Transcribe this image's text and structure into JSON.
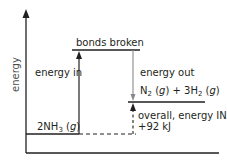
{
  "diagram": {
    "type": "energy-level-diagram",
    "axis": {
      "y_label": "energy"
    },
    "levels": [
      {
        "id": "reactants",
        "label_main": "2NH",
        "label_sub": "3",
        "label_state": " (",
        "label_italic": "g",
        "label_end": ")"
      },
      {
        "id": "bonds-broken",
        "label": "bonds broken"
      },
      {
        "id": "products",
        "part1": "N",
        "sub1": "2",
        "part2": " (",
        "ital1": "g",
        "part3": ") + 3H",
        "sub2": "2",
        "part4": " (",
        "ital2": "g",
        "part5": ")"
      }
    ],
    "arrows": {
      "energy_in": "energy in",
      "energy_out": "energy out",
      "overall_line1": "overall, energy IN",
      "overall_line2": "+92 kJ"
    },
    "colors": {
      "ink": "#231f20",
      "energy_out_arrow": "#8a8a8c"
    }
  }
}
